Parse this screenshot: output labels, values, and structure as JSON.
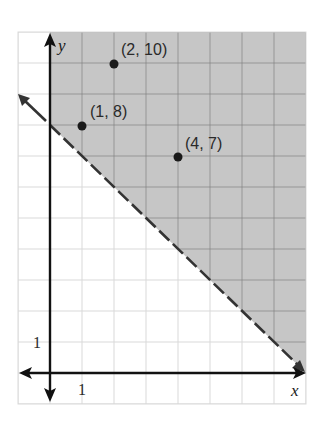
{
  "chart_data": {
    "type": "scatter",
    "title": "",
    "xlabel": "x",
    "ylabel": "y",
    "xlim": [
      -1,
      8
    ],
    "ylim": [
      -1,
      11
    ],
    "grid": true,
    "tick_labels": {
      "x": [
        "1"
      ],
      "y": [
        "1"
      ]
    },
    "points": [
      {
        "x": 1,
        "y": 8,
        "label": "(1, 8)"
      },
      {
        "x": 2,
        "y": 10,
        "label": "(2, 10)"
      },
      {
        "x": 4,
        "y": 7,
        "label": "(4, 7)"
      }
    ],
    "boundary_line": {
      "equation": "y = -x + 8",
      "slope": -1,
      "intercept": 8,
      "style": "dashed",
      "from": [
        -1,
        9
      ],
      "to": [
        8,
        0
      ]
    },
    "shaded_region": "y > -x + 8 (x >= 0)",
    "colors": {
      "shade": "#c6c6c6",
      "grid_shaded": "#8c8c8c",
      "grid_light": "#d9d9d9",
      "axis": "#111111",
      "line": "#333333",
      "point": "#1a1a1a"
    }
  },
  "labels": {
    "x_axis": "x",
    "y_axis": "y",
    "x_tick": "1",
    "y_tick": "1",
    "p1": "(1, 8)",
    "p2": "(2, 10)",
    "p3": "(4, 7)"
  }
}
